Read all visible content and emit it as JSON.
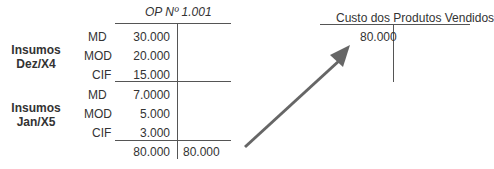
{
  "op_account": {
    "title": "OP Nº 1.001",
    "groups": [
      {
        "label_line1": "Insumos",
        "label_line2": "Dez/X4"
      },
      {
        "label_line1": "Insumos",
        "label_line2": "Jan/X5"
      }
    ],
    "rows": [
      {
        "item": "MD",
        "debit": "30.000"
      },
      {
        "item": "MOD",
        "debit": "20.000"
      },
      {
        "item": "CIF",
        "debit": "15.000"
      },
      {
        "item": "MD",
        "debit": "7.0000"
      },
      {
        "item": "MOD",
        "debit": "5.000"
      },
      {
        "item": "CIF",
        "debit": "3.000"
      }
    ],
    "total_debit": "80.000",
    "total_credit": "80.000"
  },
  "cpv_account": {
    "title": "Custo dos Produtos Vendidos",
    "debit": "80.000"
  },
  "arrow": {
    "meaning": "transfer from OP to CPV",
    "color": "#666666"
  }
}
